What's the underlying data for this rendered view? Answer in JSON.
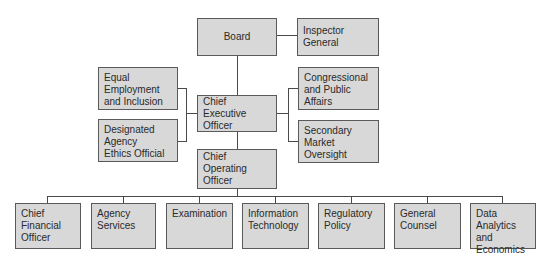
{
  "chart": {
    "board": "Board",
    "inspector_general": "Inspector\nGeneral",
    "ceo": "Chief Executive\nOfficer",
    "coo": "Chief Operating\nOfficer",
    "left_staff": [
      "Equal\nEmployment\nand Inclusion",
      "Designated\nAgency\nEthics Official"
    ],
    "right_staff": [
      "Congressional\nand Public\nAffairs",
      "Secondary\nMarket\nOversight"
    ],
    "divisions": [
      "Chief\nFinancial\nOfficer",
      "Agency\nServices",
      "Examination",
      "Information\nTechnology",
      "Regulatory\nPolicy",
      "General\nCounsel",
      "Data\nAnalytics and\nEconomics"
    ]
  },
  "colors": {
    "box_fill": "#d8d8d8",
    "box_border": "#5a5a5a",
    "connector": "#4a4a4a"
  }
}
